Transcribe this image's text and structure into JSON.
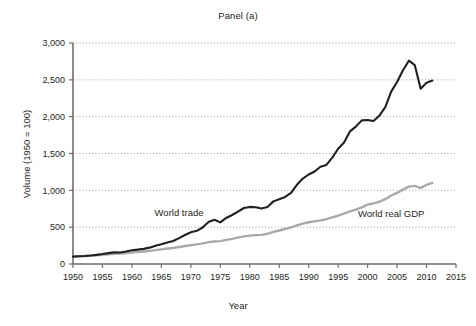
{
  "chart_data": {
    "type": "line",
    "title": "Panel (a)",
    "xlabel": "Year",
    "ylabel": "Volume (1950 = 100)",
    "xlim": [
      1950,
      2015
    ],
    "ylim": [
      0,
      3000
    ],
    "xticks": [
      1950,
      1955,
      1960,
      1965,
      1970,
      1975,
      1980,
      1985,
      1990,
      1995,
      2000,
      2005,
      2010,
      2015
    ],
    "xtick_labels": [
      "1950",
      "1955",
      "1960",
      "1965",
      "1970",
      "1975",
      "1980",
      "1985",
      "1990",
      "1995",
      "2000",
      "2005",
      "2010",
      "2015"
    ],
    "yticks": [
      0,
      500,
      1000,
      1500,
      2000,
      2500,
      3000
    ],
    "ytick_labels": [
      "0",
      "500",
      "1,000",
      "1,500",
      "2,000",
      "2,500",
      "3,000"
    ],
    "grid": "horizontal-dotted",
    "legend_position": "inline-annotations",
    "x": [
      1950,
      1951,
      1952,
      1953,
      1954,
      1955,
      1956,
      1957,
      1958,
      1959,
      1960,
      1961,
      1962,
      1963,
      1964,
      1965,
      1966,
      1967,
      1968,
      1969,
      1970,
      1971,
      1972,
      1973,
      1974,
      1975,
      1976,
      1977,
      1978,
      1979,
      1980,
      1981,
      1982,
      1983,
      1984,
      1985,
      1986,
      1987,
      1988,
      1989,
      1990,
      1991,
      1992,
      1993,
      1994,
      1995,
      1996,
      1997,
      1998,
      1999,
      2000,
      2001,
      2002,
      2003,
      2004,
      2005,
      2006,
      2007,
      2008,
      2009,
      2010,
      2011
    ],
    "series": [
      {
        "name": "World trade",
        "color": "#231f20",
        "values": [
          100,
          105,
          108,
          115,
          124,
          135,
          148,
          158,
          156,
          170,
          186,
          195,
          205,
          222,
          247,
          268,
          292,
          312,
          352,
          394,
          430,
          450,
          495,
          570,
          600,
          565,
          625,
          665,
          710,
          760,
          775,
          770,
          752,
          775,
          850,
          880,
          910,
          965,
          1075,
          1160,
          1215,
          1255,
          1320,
          1345,
          1445,
          1565,
          1650,
          1800,
          1865,
          1950,
          1955,
          1940,
          2015,
          2130,
          2340,
          2470,
          2630,
          2760,
          2700,
          2380,
          2460,
          2490
        ],
        "label_text": "World trade",
        "label_x": 1968,
        "label_y": 650
      },
      {
        "name": "World real GDP",
        "color": "#a7a9ac",
        "values": [
          100,
          104,
          108,
          113,
          118,
          125,
          131,
          137,
          141,
          148,
          156,
          162,
          170,
          178,
          189,
          199,
          210,
          218,
          231,
          245,
          256,
          266,
          280,
          297,
          305,
          310,
          328,
          342,
          358,
          375,
          385,
          392,
          395,
          410,
          435,
          455,
          475,
          498,
          525,
          548,
          567,
          578,
          592,
          608,
          632,
          658,
          685,
          715,
          738,
          768,
          805,
          822,
          845,
          880,
          930,
          965,
          1010,
          1050,
          1060,
          1030,
          1075,
          1100
        ],
        "label_text": "World real GDP",
        "label_x": 2004,
        "label_y": 640
      }
    ]
  },
  "figure": {
    "panel_title": "Panel (a)",
    "x_axis_title": "Year",
    "y_axis_title": "Volume (1950 = 100)"
  }
}
